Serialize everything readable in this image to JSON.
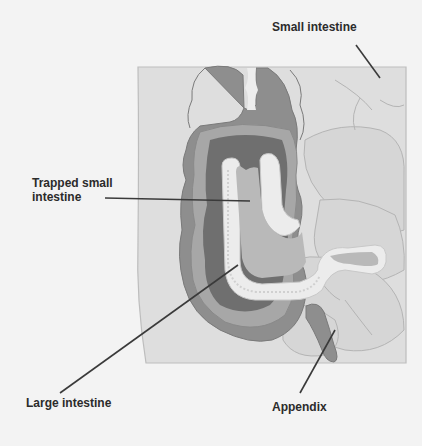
{
  "diagram": {
    "labels": {
      "small_intestine": "Small intestine",
      "trapped_small_intestine": "Trapped small intestine",
      "large_intestine": "Large intestine",
      "appendix": "Appendix"
    },
    "colors": {
      "background": "#f3f3f3",
      "panel": "#dedede",
      "panel_border": "#bdbdbd",
      "large_intestine_outer": "#8e8e8e",
      "large_intestine_mid": "#a7a7a7",
      "lumen_dark": "#6f6f6f",
      "small_intestine_wall": "#ececec",
      "small_intestine_inner": "#b9b9b9",
      "small_intestine_loops": "#d6d6d6",
      "leader_line": "#3a3a3a",
      "label_text": "#2b2b2b"
    }
  }
}
